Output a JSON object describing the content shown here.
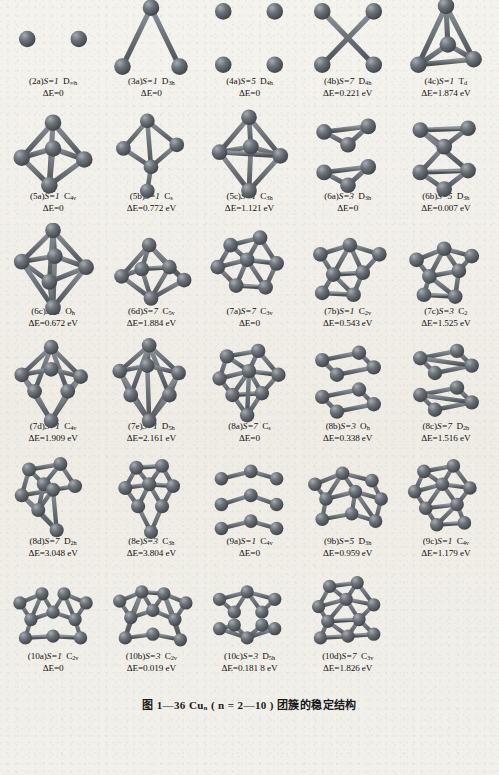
{
  "figure": {
    "caption": "图 1—36   Cu<sub>n</sub> ( n = 2—10 ) 团簇的稳定结构",
    "caption_plain": "图 1—36 Cun (n = 2—10) 团簇的稳定结构",
    "atom_color": "#6d737a",
    "atom_highlight": "#a7acb2",
    "bond_color": "#6b7177",
    "page_color": "#f3f1ec"
  },
  "clusters": [
    {
      "id": "2a",
      "label": "(2a)",
      "spin": "S=1",
      "sym": "D",
      "sym_sub": "∞h",
      "de": "ΔE=0",
      "type": "dimer"
    },
    {
      "id": "3a",
      "label": "(3a)",
      "spin": "S=1",
      "sym": "D",
      "sym_sub": "3h",
      "de": "ΔE=0",
      "type": "triangle"
    },
    {
      "id": "4a",
      "label": "(4a)",
      "spin": "S=5",
      "sym": "D",
      "sym_sub": "4h",
      "de": "ΔE=0",
      "type": "square"
    },
    {
      "id": "4b",
      "label": "(4b)",
      "spin": "S=7",
      "sym": "D",
      "sym_sub": "4h",
      "de": "ΔE=0.221 eV",
      "type": "square-x"
    },
    {
      "id": "4c",
      "label": "(4c)",
      "spin": "S=1",
      "sym": "T",
      "sym_sub": "d",
      "de": "ΔE=1.874 eV",
      "type": "tetra"
    },
    {
      "id": "5a",
      "label": "(5a)",
      "spin": "S=1",
      "sym": "C",
      "sym_sub": "4v",
      "de": "ΔE=0",
      "type": "pyramid5"
    },
    {
      "id": "5b",
      "label": "(5b)",
      "spin": "S=1",
      "sym": "C",
      "sym_sub": "s",
      "de": "ΔE=0.772 eV",
      "type": "open5"
    },
    {
      "id": "5c",
      "label": "(5c)",
      "spin": "S=1",
      "sym": "C",
      "sym_sub": "3h",
      "de": "ΔE=1.121 eV",
      "type": "bipyr5"
    },
    {
      "id": "6a",
      "label": "(6a)",
      "spin": "S=3",
      "sym": "D",
      "sym_sub": "3h",
      "de": "ΔE=0",
      "type": "prism6"
    },
    {
      "id": "6b",
      "label": "(6b)",
      "spin": "S=5",
      "sym": "D",
      "sym_sub": "3h",
      "de": "ΔE=0.007 eV",
      "type": "prism6b"
    },
    {
      "id": "6c",
      "label": "(6c)",
      "spin": "S=1",
      "sym": "O",
      "sym_sub": "h",
      "de": "ΔE=0.672 eV",
      "type": "octa"
    },
    {
      "id": "6d",
      "label": "(6d)",
      "spin": "S=7",
      "sym": "C",
      "sym_sub": "5v",
      "de": "ΔE=1.884 eV",
      "type": "pyr6"
    },
    {
      "id": "7a",
      "label": "(7a)",
      "spin": "S=7",
      "sym": "C",
      "sym_sub": "3v",
      "de": "ΔE=0",
      "type": "cap7"
    },
    {
      "id": "7b",
      "label": "(7b)",
      "spin": "S=1",
      "sym": "C",
      "sym_sub": "2v",
      "de": "ΔE=0.543 eV",
      "type": "flat7"
    },
    {
      "id": "7c",
      "label": "(7c)",
      "spin": "S=3",
      "sym": "C",
      "sym_sub": "2",
      "de": "ΔE=1.525 eV",
      "type": "twist7"
    },
    {
      "id": "7d",
      "label": "(7d)",
      "spin": "S=1",
      "sym": "C",
      "sym_sub": "4v",
      "de": "ΔE=1.909 eV",
      "type": "bipyr7"
    },
    {
      "id": "7e",
      "label": "(7e)",
      "spin": "S=1",
      "sym": "D",
      "sym_sub": "5h",
      "de": "ΔE=2.161 eV",
      "type": "penta7"
    },
    {
      "id": "8a",
      "label": "(8a)",
      "spin": "S=7",
      "sym": "C",
      "sym_sub": "s",
      "de": "ΔE=0",
      "type": "cluster8a"
    },
    {
      "id": "8b",
      "label": "(8b)",
      "spin": "S=3",
      "sym": "O",
      "sym_sub": "h",
      "de": "ΔE=0.338 eV",
      "type": "cube8"
    },
    {
      "id": "8c",
      "label": "(8c)",
      "spin": "S=7",
      "sym": "D",
      "sym_sub": "2h",
      "de": "ΔE=1.516 eV",
      "type": "prism8"
    },
    {
      "id": "8d",
      "label": "(8d)",
      "spin": "S=7",
      "sym": "D",
      "sym_sub": "2h",
      "de": "ΔE=3.048 eV",
      "type": "stack8"
    },
    {
      "id": "8e",
      "label": "(8e)",
      "spin": "S=3",
      "sym": "C",
      "sym_sub": "3h",
      "de": "ΔE=3.804 eV",
      "type": "open8"
    },
    {
      "id": "9a",
      "label": "(9a)",
      "spin": "S=1",
      "sym": "C",
      "sym_sub": "4v",
      "de": "ΔE=0",
      "type": "cube9"
    },
    {
      "id": "9b",
      "label": "(9b)",
      "spin": "S=5",
      "sym": "D",
      "sym_sub": "3h",
      "de": "ΔE=0.959 eV",
      "type": "wide9"
    },
    {
      "id": "9c",
      "label": "(9c)",
      "spin": "S=1",
      "sym": "C",
      "sym_sub": "4v",
      "de": "ΔE=1.179 eV",
      "type": "deca9"
    },
    {
      "id": "10a",
      "label": "(10a)",
      "spin": "S=1",
      "sym": "C",
      "sym_sub": "2v",
      "de": "ΔE=0",
      "type": "flat10"
    },
    {
      "id": "10b",
      "label": "(10b)",
      "spin": "S=3",
      "sym": "C",
      "sym_sub": "2v",
      "de": "ΔE=0.019 eV",
      "type": "flat10b"
    },
    {
      "id": "10c",
      "label": "(10c)",
      "spin": "S=3",
      "sym": "D",
      "sym_sub": "5h",
      "de": "ΔE=0.181 8 eV",
      "type": "prism10"
    },
    {
      "id": "10d",
      "label": "(10d)",
      "spin": "S=7",
      "sym": "C",
      "sym_sub": "3v",
      "de": "ΔE=1.826 eV",
      "type": "cap10"
    }
  ]
}
